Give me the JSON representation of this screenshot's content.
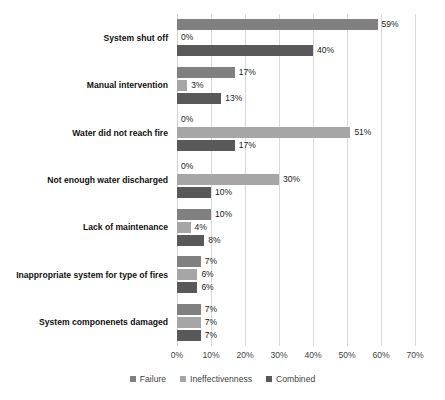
{
  "chart_data": {
    "type": "bar",
    "orientation": "horizontal",
    "title": "",
    "xlabel": "",
    "ylabel": "",
    "xlim": [
      0,
      70
    ],
    "xtick_labels": [
      "0%",
      "10%",
      "20%",
      "30%",
      "40%",
      "50%",
      "60%",
      "70%"
    ],
    "xticks": [
      0,
      10,
      20,
      30,
      40,
      50,
      60,
      70
    ],
    "grid": "vertical",
    "legend_position": "bottom-center",
    "categories": [
      "System shut off",
      "Manual intervention",
      "Water did not reach fire",
      "Not enough water discharged",
      "Lack of maintenance",
      "Inappropriate system for type of fires",
      "System componenets damaged"
    ],
    "series": [
      {
        "name": "Failure",
        "color": "#808080",
        "values": [
          59,
          17,
          0,
          0,
          10,
          7,
          7
        ],
        "labels": [
          "59%",
          "17%",
          "0%",
          "0%",
          "10%",
          "7%",
          "7%"
        ]
      },
      {
        "name": "Ineffectivenness",
        "color": "#a6a6a6",
        "values": [
          0,
          3,
          51,
          30,
          4,
          6,
          7
        ],
        "labels": [
          "0%",
          "3%",
          "51%",
          "30%",
          "4%",
          "6%",
          "7%"
        ]
      },
      {
        "name": "Combined",
        "color": "#595959",
        "values": [
          40,
          13,
          17,
          10,
          8,
          6,
          7
        ],
        "labels": [
          "40%",
          "13%",
          "17%",
          "10%",
          "8%",
          "6%",
          "7%"
        ]
      }
    ]
  },
  "legend": {
    "items": [
      {
        "label": "Failure",
        "color": "#808080"
      },
      {
        "label": "Ineffectivenness",
        "color": "#a6a6a6"
      },
      {
        "label": "Combined",
        "color": "#595959"
      }
    ]
  },
  "colors": {
    "gridline": "#d9d9d9",
    "text": "#1a1a1a",
    "axis_text": "#3f3f3f",
    "background": "#ffffff"
  }
}
